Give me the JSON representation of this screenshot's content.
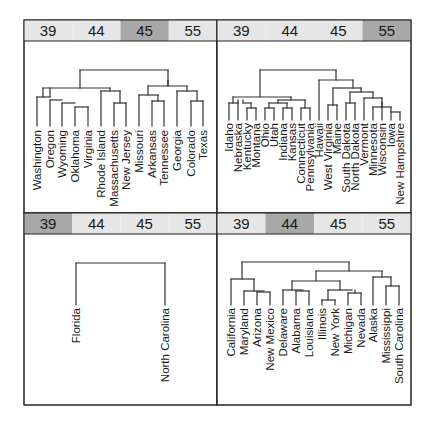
{
  "chart_data": {
    "type": "dendrogram-panels",
    "layout": "2x2 trellis grid",
    "strip_levels": [
      "39",
      "44",
      "45",
      "55"
    ],
    "colors": {
      "strip_background": "#e6e6e6",
      "strip_highlight": "#a8a8a8",
      "line": "#333333",
      "border": "#222222"
    },
    "panels": [
      {
        "position": "top-left",
        "highlight": "45",
        "leaves": [
          "Washington",
          "Oregon",
          "Wyoming",
          "Oklahoma",
          "Virginia",
          "Rhode Island",
          "Massachusetts",
          "New Jersey",
          "Missouri",
          "Arkansas",
          "Tennessee",
          "Georgia",
          "Colorado",
          "Texas"
        ]
      },
      {
        "position": "top-right",
        "highlight": "55",
        "leaves": [
          "Idaho",
          "Nebraska",
          "Kentucky",
          "Montana",
          "Ohio",
          "Utah",
          "Indiana",
          "Kansas",
          "Connecticut",
          "Pennsylvania",
          "Hawaii",
          "West Virginia",
          "Maine",
          "South Dakota",
          "North Dakota",
          "Vermont",
          "Minnesota",
          "Wisconsin",
          "Iowa",
          "New Hampshire"
        ]
      },
      {
        "position": "bottom-left",
        "highlight": "39",
        "leaves": [
          "Florida",
          "North Carolina"
        ]
      },
      {
        "position": "bottom-right",
        "highlight": "44",
        "leaves": [
          "California",
          "Maryland",
          "Arizona",
          "New Mexico",
          "Delaware",
          "Alabama",
          "Louisiana",
          "Illinois",
          "New York",
          "Michigan",
          "Nevada",
          "Alaska",
          "Mississippi",
          "South Carolina"
        ]
      }
    ]
  },
  "panels": [
    {
      "strip": [
        "39",
        "44",
        "45",
        "55"
      ],
      "highlight_index": 2,
      "leaves": [
        {
          "label": "Washington",
          "x": 37
        },
        {
          "label": "Oregon",
          "x": 50
        },
        {
          "label": "Wyoming",
          "x": 62
        },
        {
          "label": "Oklahoma",
          "x": 75
        },
        {
          "label": "Virginia",
          "x": 88
        },
        {
          "label": "Rhode Island",
          "x": 101
        },
        {
          "label": "Massachusetts",
          "x": 114
        },
        {
          "label": "New Jersey",
          "x": 126
        },
        {
          "label": "Missouri",
          "x": 139
        },
        {
          "label": "Arkansas",
          "x": 152
        },
        {
          "label": "Tennessee",
          "x": 164
        },
        {
          "label": "Georgia",
          "x": 177
        },
        {
          "label": "Colorado",
          "x": 191
        },
        {
          "label": "Texas",
          "x": 203
        }
      ],
      "segments": [
        [
          37,
          97,
          37,
          126
        ],
        [
          37,
          97,
          50,
          97
        ],
        [
          50,
          100,
          50,
          126
        ],
        [
          50,
          100,
          62,
          100
        ],
        [
          62,
          103,
          62,
          126
        ],
        [
          62,
          103,
          75,
          103
        ],
        [
          75,
          107,
          75,
          126
        ],
        [
          75,
          107,
          88,
          107
        ],
        [
          88,
          107,
          88,
          126
        ],
        [
          43,
          88,
          43,
          97
        ],
        [
          43,
          88,
          110,
          88
        ],
        [
          110,
          88,
          110,
          91
        ],
        [
          101,
          91,
          101,
          126
        ],
        [
          101,
          91,
          120,
          91
        ],
        [
          120,
          91,
          120,
          103
        ],
        [
          114,
          103,
          114,
          126
        ],
        [
          114,
          103,
          126,
          103
        ],
        [
          126,
          103,
          126,
          126
        ],
        [
          50,
          88,
          50,
          97
        ],
        [
          139,
          95,
          139,
          126
        ],
        [
          139,
          95,
          158,
          95
        ],
        [
          158,
          95,
          158,
          101
        ],
        [
          152,
          101,
          152,
          126
        ],
        [
          152,
          101,
          164,
          101
        ],
        [
          164,
          101,
          164,
          126
        ],
        [
          148,
          86,
          148,
          95
        ],
        [
          148,
          86,
          187,
          86
        ],
        [
          187,
          86,
          187,
          91
        ],
        [
          177,
          91,
          177,
          126
        ],
        [
          177,
          91,
          197,
          91
        ],
        [
          197,
          91,
          197,
          101
        ],
        [
          191,
          101,
          191,
          126
        ],
        [
          191,
          101,
          203,
          101
        ],
        [
          203,
          101,
          203,
          126
        ],
        [
          168,
          86,
          168,
          80
        ],
        [
          80,
          70,
          80,
          88
        ],
        [
          80,
          70,
          168,
          70
        ],
        [
          168,
          70,
          168,
          86
        ]
      ]
    },
    {
      "strip": [
        "39",
        "44",
        "45",
        "55"
      ],
      "highlight_index": 3,
      "leaves": [
        {
          "label": "Idaho",
          "x": 229
        },
        {
          "label": "Nebraska",
          "x": 238
        },
        {
          "label": "Kentucky",
          "x": 247
        },
        {
          "label": "Montana",
          "x": 256
        },
        {
          "label": "Ohio",
          "x": 265
        },
        {
          "label": "Utah",
          "x": 274
        },
        {
          "label": "Indiana",
          "x": 283
        },
        {
          "label": "Kansas",
          "x": 292
        },
        {
          "label": "Connecticut",
          "x": 301
        },
        {
          "label": "Pennsylvania",
          "x": 310
        },
        {
          "label": "Hawaii",
          "x": 319
        },
        {
          "label": "West Virginia",
          "x": 328
        },
        {
          "label": "Maine",
          "x": 337
        },
        {
          "label": "South Dakota",
          "x": 346
        },
        {
          "label": "North Dakota",
          "x": 355
        },
        {
          "label": "Vermont",
          "x": 364
        },
        {
          "label": "Minnesota",
          "x": 373
        },
        {
          "label": "Wisconsin",
          "x": 382
        },
        {
          "label": "Iowa",
          "x": 391
        },
        {
          "label": "New Hampshire",
          "x": 400
        }
      ],
      "segments": [
        [
          229,
          103,
          229,
          120
        ],
        [
          229,
          103,
          238,
          103
        ],
        [
          238,
          103,
          238,
          120
        ],
        [
          233,
          97,
          233,
          103
        ],
        [
          247,
          108,
          247,
          120
        ],
        [
          247,
          108,
          256,
          108
        ],
        [
          256,
          108,
          256,
          120
        ],
        [
          243,
          103,
          243,
          100
        ],
        [
          243,
          103,
          251,
          103
        ],
        [
          251,
          103,
          251,
          108
        ],
        [
          238,
          100,
          238,
          103
        ],
        [
          265,
          108,
          265,
          120
        ],
        [
          265,
          108,
          274,
          108
        ],
        [
          274,
          108,
          274,
          120
        ],
        [
          283,
          108,
          283,
          120
        ],
        [
          283,
          108,
          292,
          108
        ],
        [
          292,
          108,
          292,
          120
        ],
        [
          269,
          103,
          269,
          108
        ],
        [
          269,
          103,
          287,
          103
        ],
        [
          287,
          103,
          287,
          108
        ],
        [
          301,
          108,
          301,
          120
        ],
        [
          301,
          108,
          310,
          108
        ],
        [
          310,
          108,
          310,
          120
        ],
        [
          278,
          100,
          278,
          103
        ],
        [
          278,
          100,
          305,
          100
        ],
        [
          305,
          100,
          305,
          108
        ],
        [
          233,
          97,
          291,
          97
        ],
        [
          291,
          97,
          291,
          100
        ],
        [
          319,
          80,
          319,
          120
        ],
        [
          328,
          105,
          328,
          120
        ],
        [
          328,
          105,
          337,
          105
        ],
        [
          337,
          105,
          337,
          120
        ],
        [
          333,
          88,
          333,
          105
        ],
        [
          346,
          103,
          346,
          120
        ],
        [
          346,
          103,
          355,
          103
        ],
        [
          355,
          103,
          355,
          120
        ],
        [
          364,
          98,
          364,
          120
        ],
        [
          364,
          98,
          382,
          98
        ],
        [
          382,
          98,
          382,
          120
        ],
        [
          373,
          107,
          373,
          120
        ],
        [
          373,
          107,
          391,
          107
        ],
        [
          391,
          107,
          391,
          120
        ],
        [
          382,
          107,
          382,
          102
        ],
        [
          391,
          112,
          400,
          112
        ],
        [
          400,
          112,
          400,
          120
        ],
        [
          350,
          92,
          350,
          103
        ],
        [
          350,
          92,
          373,
          92
        ],
        [
          373,
          92,
          373,
          98
        ],
        [
          333,
          88,
          361,
          88
        ],
        [
          361,
          88,
          361,
          92
        ],
        [
          319,
          80,
          353,
          80
        ],
        [
          353,
          80,
          353,
          88
        ],
        [
          260,
          70,
          260,
          97
        ],
        [
          260,
          70,
          336,
          70
        ],
        [
          336,
          70,
          336,
          80
        ]
      ]
    },
    {
      "strip": [
        "39",
        "44",
        "45",
        "55"
      ],
      "highlight_index": 0,
      "leaves": [
        {
          "label": "Florida",
          "x": 76
        },
        {
          "label": "North Carolina",
          "x": 165
        }
      ],
      "segments": [
        [
          76,
          263,
          76,
          305
        ],
        [
          76,
          263,
          165,
          263
        ],
        [
          165,
          263,
          165,
          305
        ]
      ]
    },
    {
      "strip": [
        "39",
        "44",
        "45",
        "55"
      ],
      "highlight_index": 1,
      "leaves": [
        {
          "label": "California",
          "x": 231
        },
        {
          "label": "Maryland",
          "x": 244
        },
        {
          "label": "Arizona",
          "x": 257
        },
        {
          "label": "New Mexico",
          "x": 270
        },
        {
          "label": "Delaware",
          "x": 283
        },
        {
          "label": "Alabama",
          "x": 296
        },
        {
          "label": "Louisiana",
          "x": 309
        },
        {
          "label": "Illinois",
          "x": 322
        },
        {
          "label": "New York",
          "x": 335
        },
        {
          "label": "Michigan",
          "x": 348
        },
        {
          "label": "Nevada",
          "x": 361
        },
        {
          "label": "Alaska",
          "x": 373
        },
        {
          "label": "Mississippi",
          "x": 386
        },
        {
          "label": "South Carolina",
          "x": 399
        }
      ],
      "segments": [
        [
          231,
          279,
          231,
          305
        ],
        [
          231,
          279,
          254,
          279
        ],
        [
          244,
          291,
          244,
          305
        ],
        [
          244,
          291,
          264,
          291
        ],
        [
          257,
          292,
          257,
          305
        ],
        [
          257,
          292,
          270,
          292
        ],
        [
          270,
          292,
          270,
          305
        ],
        [
          254,
          279,
          254,
          291
        ],
        [
          283,
          290,
          283,
          305
        ],
        [
          283,
          290,
          303,
          290
        ],
        [
          296,
          291,
          296,
          305
        ],
        [
          296,
          291,
          309,
          291
        ],
        [
          309,
          291,
          309,
          305
        ],
        [
          292,
          281,
          292,
          290
        ],
        [
          322,
          300,
          322,
          305
        ],
        [
          322,
          300,
          335,
          300
        ],
        [
          335,
          300,
          335,
          305
        ],
        [
          328,
          290,
          328,
          300
        ],
        [
          328,
          290,
          352,
          290
        ],
        [
          348,
          293,
          348,
          305
        ],
        [
          348,
          293,
          361,
          293
        ],
        [
          361,
          293,
          361,
          305
        ],
        [
          355,
          290,
          355,
          293
        ],
        [
          292,
          281,
          340,
          281
        ],
        [
          340,
          281,
          340,
          290
        ],
        [
          373,
          277,
          373,
          305
        ],
        [
          373,
          277,
          391,
          277
        ],
        [
          386,
          286,
          386,
          305
        ],
        [
          386,
          286,
          399,
          286
        ],
        [
          399,
          286,
          399,
          305
        ],
        [
          391,
          277,
          391,
          286
        ],
        [
          316,
          271,
          316,
          281
        ],
        [
          316,
          271,
          382,
          271
        ],
        [
          382,
          271,
          382,
          277
        ],
        [
          242,
          262,
          242,
          279
        ],
        [
          242,
          262,
          349,
          262
        ],
        [
          349,
          262,
          349,
          271
        ]
      ]
    }
  ]
}
